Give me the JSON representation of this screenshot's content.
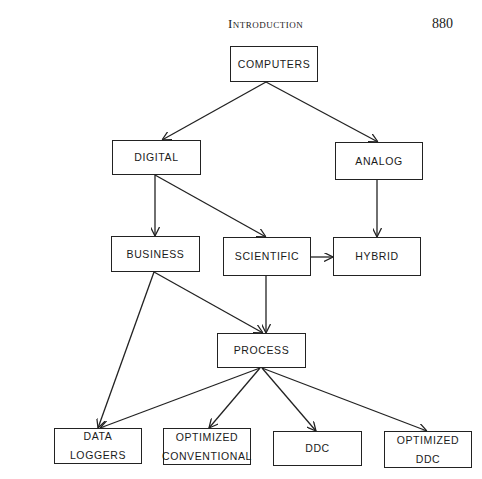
{
  "header": {
    "running_title": "Introduction",
    "page_number": "880"
  },
  "diagram": {
    "nodes": [
      {
        "id": "computers",
        "lines": [
          "COMPUTERS"
        ],
        "x": 230,
        "y": 46,
        "w": 88,
        "h": 36
      },
      {
        "id": "digital",
        "lines": [
          "DIGITAL"
        ],
        "x": 112,
        "y": 140,
        "w": 89,
        "h": 35
      },
      {
        "id": "analog",
        "lines": [
          "ANALOG"
        ],
        "x": 335,
        "y": 142,
        "w": 88,
        "h": 38
      },
      {
        "id": "business",
        "lines": [
          "BUSINESS"
        ],
        "x": 111,
        "y": 236,
        "w": 89,
        "h": 36
      },
      {
        "id": "scientific",
        "lines": [
          "SCIENTIFIC"
        ],
        "x": 223,
        "y": 237,
        "w": 88,
        "h": 39
      },
      {
        "id": "hybrid",
        "lines": [
          "HYBRID"
        ],
        "x": 333,
        "y": 237,
        "w": 88,
        "h": 39
      },
      {
        "id": "process",
        "lines": [
          "PROCESS"
        ],
        "x": 217,
        "y": 333,
        "w": 89,
        "h": 35
      },
      {
        "id": "data-loggers",
        "lines": [
          "DATA",
          "LOGGERS"
        ],
        "x": 54,
        "y": 428,
        "w": 88,
        "h": 36
      },
      {
        "id": "optimized-conventional",
        "lines": [
          "OPTIMIZED",
          "CONVENTIONAL"
        ],
        "x": 163,
        "y": 428,
        "w": 88,
        "h": 37
      },
      {
        "id": "ddc",
        "lines": [
          "DDC"
        ],
        "x": 273,
        "y": 431,
        "w": 89,
        "h": 35
      },
      {
        "id": "optimized-ddc",
        "lines": [
          "OPTIMIZED",
          "DDC"
        ],
        "x": 384,
        "y": 431,
        "w": 88,
        "h": 37
      }
    ],
    "edges": [
      {
        "from": "computers",
        "to": "digital",
        "x1": 266,
        "y1": 82,
        "x2": 162,
        "y2": 140
      },
      {
        "from": "computers",
        "to": "analog",
        "x1": 266,
        "y1": 82,
        "x2": 378,
        "y2": 142
      },
      {
        "from": "digital",
        "to": "business",
        "x1": 155,
        "y1": 175,
        "x2": 155,
        "y2": 236
      },
      {
        "from": "digital",
        "to": "scientific",
        "x1": 155,
        "y1": 175,
        "x2": 266,
        "y2": 237
      },
      {
        "from": "analog",
        "to": "hybrid",
        "x1": 377,
        "y1": 180,
        "x2": 377,
        "y2": 237
      },
      {
        "from": "scientific",
        "to": "hybrid",
        "x1": 311,
        "y1": 257,
        "x2": 333,
        "y2": 257
      },
      {
        "from": "business",
        "to": "process",
        "x1": 154,
        "y1": 272,
        "x2": 263,
        "y2": 333
      },
      {
        "from": "scientific",
        "to": "process",
        "x1": 266,
        "y1": 276,
        "x2": 266,
        "y2": 333
      },
      {
        "from": "business",
        "to": "data-loggers",
        "x1": 154,
        "y1": 272,
        "x2": 98,
        "y2": 428
      },
      {
        "from": "process",
        "to": "data-loggers",
        "x1": 260,
        "y1": 368,
        "x2": 100,
        "y2": 428
      },
      {
        "from": "process",
        "to": "optimized-conventional",
        "x1": 260,
        "y1": 368,
        "x2": 209,
        "y2": 428
      },
      {
        "from": "process",
        "to": "ddc",
        "x1": 262,
        "y1": 368,
        "x2": 316,
        "y2": 431
      },
      {
        "from": "process",
        "to": "optimized-ddc",
        "x1": 262,
        "y1": 368,
        "x2": 427,
        "y2": 431
      }
    ]
  }
}
